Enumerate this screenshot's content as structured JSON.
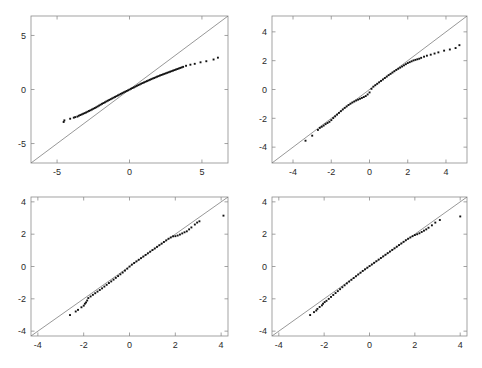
{
  "figure": {
    "title": "",
    "background_color": "#ffffff",
    "layout": "2x2 grid of panels",
    "panels_count": 4
  },
  "chart_data": [
    {
      "type": "scatter",
      "id": "panel-top-left",
      "title": "",
      "xlabel": "",
      "ylabel": "",
      "xlim": [
        -6.8,
        6.8
      ],
      "ylim": [
        -6.8,
        6.8
      ],
      "xticks": [
        -5,
        0,
        5
      ],
      "yticks": [
        -5,
        0,
        5
      ],
      "xticklabels": [
        "-5",
        "0",
        "5"
      ],
      "yticklabels": [
        "-5",
        "0",
        "5"
      ],
      "grid": false,
      "legend": null,
      "series": [
        {
          "name": "reference line",
          "type": "line",
          "color": "#6b6b6b",
          "x": [
            -6.8,
            6.8
          ],
          "y": [
            -6.8,
            6.8
          ]
        },
        {
          "name": "quantiles",
          "type": "scatter",
          "color": "#111111",
          "x": [
            -4.55,
            -4.5,
            -4.1,
            -3.85,
            -3.75,
            -3.6,
            -3.5,
            -3.4,
            -3.3,
            -3.2,
            -3.1,
            -3.0,
            -2.9,
            -2.8,
            -2.7,
            -2.6,
            -2.5,
            -2.4,
            -2.3,
            -2.2,
            -2.1,
            -2.0,
            -1.9,
            -1.8,
            -1.7,
            -1.6,
            -1.5,
            -1.4,
            -1.3,
            -1.2,
            -1.1,
            -1.0,
            -0.9,
            -0.8,
            -0.7,
            -0.6,
            -0.5,
            -0.4,
            -0.3,
            -0.2,
            -0.1,
            0.0,
            0.1,
            0.2,
            0.3,
            0.4,
            0.5,
            0.6,
            0.7,
            0.8,
            0.9,
            1.0,
            1.1,
            1.2,
            1.3,
            1.4,
            1.5,
            1.6,
            1.7,
            1.8,
            1.9,
            2.0,
            2.1,
            2.2,
            2.3,
            2.4,
            2.5,
            2.6,
            2.7,
            2.8,
            2.9,
            3.0,
            3.1,
            3.2,
            3.3,
            3.4,
            3.5,
            3.6,
            3.7,
            3.9,
            4.2,
            4.5,
            4.9,
            5.3,
            5.8,
            6.1
          ],
          "y": [
            -3.0,
            -2.85,
            -2.7,
            -2.6,
            -2.55,
            -2.5,
            -2.42,
            -2.36,
            -2.3,
            -2.24,
            -2.18,
            -2.12,
            -2.05,
            -1.98,
            -1.92,
            -1.85,
            -1.78,
            -1.71,
            -1.64,
            -1.56,
            -1.48,
            -1.4,
            -1.32,
            -1.25,
            -1.18,
            -1.1,
            -1.03,
            -0.96,
            -0.89,
            -0.82,
            -0.75,
            -0.68,
            -0.61,
            -0.54,
            -0.47,
            -0.4,
            -0.33,
            -0.26,
            -0.2,
            -0.13,
            -0.07,
            0.0,
            0.07,
            0.14,
            0.2,
            0.27,
            0.34,
            0.41,
            0.47,
            0.54,
            0.6,
            0.66,
            0.72,
            0.78,
            0.84,
            0.9,
            0.96,
            1.02,
            1.07,
            1.13,
            1.19,
            1.24,
            1.3,
            1.35,
            1.4,
            1.45,
            1.5,
            1.55,
            1.6,
            1.65,
            1.7,
            1.75,
            1.8,
            1.85,
            1.9,
            1.95,
            2.0,
            2.05,
            2.1,
            2.2,
            2.3,
            2.38,
            2.52,
            2.62,
            2.78,
            2.95
          ]
        }
      ]
    },
    {
      "type": "scatter",
      "id": "panel-top-right",
      "title": "",
      "xlabel": "",
      "ylabel": "",
      "xlim": [
        -5.1,
        5.1
      ],
      "ylim": [
        -5.1,
        5.1
      ],
      "xticks": [
        -4,
        -2,
        0,
        2,
        4
      ],
      "yticks": [
        -4,
        -2,
        0,
        2,
        4
      ],
      "xticklabels": [
        "-4",
        "-2",
        "0",
        "2",
        "4"
      ],
      "yticklabels": [
        "-4",
        "-2",
        "0",
        "2",
        "4"
      ],
      "grid": false,
      "legend": null,
      "series": [
        {
          "name": "reference line",
          "type": "line",
          "color": "#6b6b6b",
          "x": [
            -5.1,
            5.1
          ],
          "y": [
            -5.1,
            5.1
          ]
        },
        {
          "name": "quantiles",
          "type": "scatter",
          "color": "#111111",
          "x": [
            -3.35,
            -3.0,
            -2.7,
            -2.6,
            -2.5,
            -2.4,
            -2.3,
            -2.2,
            -2.1,
            -2.0,
            -1.9,
            -1.8,
            -1.7,
            -1.6,
            -1.5,
            -1.4,
            -1.3,
            -1.2,
            -1.1,
            -1.0,
            -0.9,
            -0.8,
            -0.7,
            -0.6,
            -0.5,
            -0.4,
            -0.3,
            -0.2,
            -0.1,
            0.0,
            0.1,
            0.2,
            0.3,
            0.4,
            0.5,
            0.6,
            0.7,
            0.8,
            0.9,
            1.0,
            1.1,
            1.2,
            1.3,
            1.4,
            1.5,
            1.6,
            1.7,
            1.8,
            1.9,
            2.0,
            2.1,
            2.2,
            2.3,
            2.4,
            2.5,
            2.6,
            2.7,
            2.85,
            3.0,
            3.2,
            3.4,
            3.6,
            3.9,
            4.2,
            4.5,
            4.7
          ],
          "y": [
            -3.55,
            -3.2,
            -2.8,
            -2.66,
            -2.58,
            -2.5,
            -2.4,
            -2.32,
            -2.24,
            -2.12,
            -1.98,
            -1.86,
            -1.74,
            -1.62,
            -1.5,
            -1.38,
            -1.27,
            -1.17,
            -1.07,
            -0.98,
            -0.9,
            -0.83,
            -0.76,
            -0.7,
            -0.64,
            -0.58,
            -0.52,
            -0.45,
            -0.34,
            -0.2,
            0.05,
            0.2,
            0.3,
            0.4,
            0.5,
            0.6,
            0.7,
            0.8,
            0.9,
            1.0,
            1.09,
            1.18,
            1.27,
            1.36,
            1.44,
            1.52,
            1.6,
            1.68,
            1.76,
            1.84,
            1.9,
            1.96,
            2.02,
            2.06,
            2.1,
            2.14,
            2.2,
            2.28,
            2.35,
            2.42,
            2.5,
            2.58,
            2.7,
            2.78,
            2.88,
            3.08
          ]
        }
      ]
    },
    {
      "type": "scatter",
      "id": "panel-bottom-left",
      "title": "",
      "xlabel": "",
      "ylabel": "",
      "xlim": [
        -4.3,
        4.3
      ],
      "ylim": [
        -4.3,
        4.3
      ],
      "xticks": [
        -4,
        -2,
        0,
        2,
        4
      ],
      "yticks": [
        -4,
        -2,
        0,
        2,
        4
      ],
      "xticklabels": [
        "-4",
        "-2",
        "0",
        "2",
        "4"
      ],
      "yticklabels": [
        "-4",
        "-2",
        "0",
        "2",
        "4"
      ],
      "grid": false,
      "legend": null,
      "series": [
        {
          "name": "reference line",
          "type": "line",
          "color": "#6b6b6b",
          "x": [
            -4.3,
            4.3
          ],
          "y": [
            -4.3,
            4.3
          ]
        },
        {
          "name": "quantiles",
          "type": "scatter",
          "color": "#111111",
          "x": [
            -2.6,
            -2.35,
            -2.25,
            -2.1,
            -2.0,
            -1.95,
            -1.9,
            -1.85,
            -1.8,
            -1.7,
            -1.6,
            -1.5,
            -1.4,
            -1.3,
            -1.2,
            -1.1,
            -1.0,
            -0.9,
            -0.8,
            -0.7,
            -0.6,
            -0.5,
            -0.4,
            -0.3,
            -0.2,
            -0.1,
            0.0,
            0.1,
            0.2,
            0.3,
            0.4,
            0.5,
            0.6,
            0.7,
            0.8,
            0.9,
            1.0,
            1.1,
            1.2,
            1.3,
            1.4,
            1.5,
            1.6,
            1.7,
            1.8,
            1.9,
            2.0,
            2.1,
            2.2,
            2.3,
            2.4,
            2.5,
            2.6,
            2.7,
            2.85,
            2.95,
            3.05,
            4.1
          ],
          "y": [
            -3.0,
            -2.78,
            -2.68,
            -2.52,
            -2.42,
            -2.3,
            -2.22,
            -2.1,
            -1.95,
            -1.85,
            -1.75,
            -1.65,
            -1.55,
            -1.45,
            -1.35,
            -1.24,
            -1.13,
            -1.02,
            -0.92,
            -0.81,
            -0.7,
            -0.59,
            -0.48,
            -0.37,
            -0.25,
            -0.13,
            0.0,
            0.12,
            0.22,
            0.32,
            0.42,
            0.52,
            0.62,
            0.72,
            0.82,
            0.92,
            1.02,
            1.12,
            1.22,
            1.32,
            1.42,
            1.52,
            1.62,
            1.72,
            1.8,
            1.87,
            1.88,
            1.92,
            1.98,
            2.05,
            2.12,
            2.18,
            2.3,
            2.42,
            2.6,
            2.72,
            2.8,
            3.15
          ]
        }
      ]
    },
    {
      "type": "scatter",
      "id": "panel-bottom-right",
      "title": "",
      "xlabel": "",
      "ylabel": "",
      "xlim": [
        -4.3,
        4.3
      ],
      "ylim": [
        -4.3,
        4.3
      ],
      "xticks": [
        -4,
        -2,
        0,
        2,
        4
      ],
      "yticks": [
        -4,
        -2,
        0,
        2,
        4
      ],
      "xticklabels": [
        "-4",
        "-2",
        "0",
        "2",
        "4"
      ],
      "yticklabels": [
        "-4",
        "-2",
        "0",
        "2",
        "4"
      ],
      "grid": false,
      "legend": null,
      "series": [
        {
          "name": "reference line",
          "type": "line",
          "color": "#6b6b6b",
          "x": [
            -4.3,
            4.3
          ],
          "y": [
            -4.3,
            4.3
          ]
        },
        {
          "name": "quantiles",
          "type": "scatter",
          "color": "#111111",
          "x": [
            -2.62,
            -2.45,
            -2.35,
            -2.3,
            -2.2,
            -2.1,
            -2.05,
            -1.98,
            -1.9,
            -1.8,
            -1.7,
            -1.6,
            -1.5,
            -1.4,
            -1.3,
            -1.2,
            -1.1,
            -1.0,
            -0.9,
            -0.8,
            -0.7,
            -0.6,
            -0.5,
            -0.4,
            -0.3,
            -0.2,
            -0.1,
            0.0,
            0.1,
            0.2,
            0.3,
            0.4,
            0.5,
            0.6,
            0.7,
            0.8,
            0.9,
            1.0,
            1.1,
            1.2,
            1.3,
            1.4,
            1.5,
            1.6,
            1.7,
            1.8,
            1.9,
            2.0,
            2.1,
            2.2,
            2.3,
            2.4,
            2.5,
            2.6,
            2.75,
            2.9,
            3.1,
            4.0
          ],
          "y": [
            -3.0,
            -2.82,
            -2.72,
            -2.62,
            -2.5,
            -2.4,
            -2.3,
            -2.2,
            -2.12,
            -2.0,
            -1.88,
            -1.76,
            -1.64,
            -1.52,
            -1.4,
            -1.28,
            -1.16,
            -1.04,
            -0.93,
            -0.82,
            -0.71,
            -0.6,
            -0.49,
            -0.38,
            -0.27,
            -0.17,
            -0.07,
            0.03,
            0.13,
            0.23,
            0.33,
            0.43,
            0.53,
            0.63,
            0.73,
            0.83,
            0.93,
            1.03,
            1.13,
            1.23,
            1.33,
            1.43,
            1.53,
            1.63,
            1.72,
            1.8,
            1.88,
            1.95,
            2.0,
            2.06,
            2.14,
            2.22,
            2.3,
            2.4,
            2.55,
            2.72,
            2.88,
            3.1
          ]
        }
      ]
    }
  ]
}
